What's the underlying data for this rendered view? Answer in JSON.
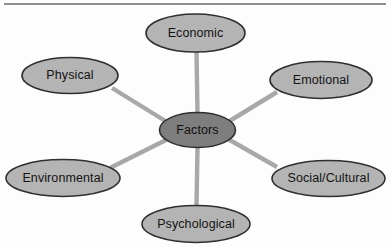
{
  "figure": {
    "background_color": "#fdfdfd",
    "top_rule": {
      "name": "header-rule",
      "color": "#8c8c92",
      "x1": 4,
      "y1": 4,
      "x2": 386,
      "y2": 4,
      "width": 2.2
    }
  },
  "chart_data": {
    "type": "diagram",
    "subtype": "radial-hub-and-spoke",
    "title": "Factors",
    "center_label": "Factors",
    "spoke_count": 6,
    "categories": [
      "Economic",
      "Emotional",
      "Social/Cultural",
      "Psychological",
      "Environmental",
      "Physical"
    ],
    "edges": [
      {
        "from": "Factors",
        "to": "Economic"
      },
      {
        "from": "Factors",
        "to": "Emotional"
      },
      {
        "from": "Factors",
        "to": "Social/Cultural"
      },
      {
        "from": "Factors",
        "to": "Psychological"
      },
      {
        "from": "Factors",
        "to": "Environmental"
      },
      {
        "from": "Factors",
        "to": "Physical"
      }
    ]
  },
  "colors": {
    "node_fill": "#b4b4b4",
    "center_fill": "#7e7e7e",
    "node_stroke": "#2f2f2f",
    "connector": "#a8a8a8",
    "label_text": "#131313",
    "rule": "#8c8c92"
  },
  "center": {
    "name": "center-node-factors",
    "label": "Factors",
    "cx": 197.5,
    "cy": 130,
    "rx": 38,
    "ry": 17.5,
    "fill": "#7e7e7e"
  },
  "nodes": [
    {
      "name": "node-economic",
      "label": "Economic",
      "cx": 195.5,
      "cy": 33,
      "rx": 49.5,
      "ry": 19,
      "fill": "#b4b4b4"
    },
    {
      "name": "node-physical",
      "label": "Physical",
      "cx": 70,
      "cy": 75.5,
      "rx": 48,
      "ry": 18,
      "fill": "#b4b4b4"
    },
    {
      "name": "node-emotional",
      "label": "Emotional",
      "cx": 321,
      "cy": 80,
      "rx": 51,
      "ry": 18.5,
      "fill": "#b4b4b4"
    },
    {
      "name": "node-environmental",
      "label": "Environmental",
      "cx": 63,
      "cy": 178,
      "rx": 57,
      "ry": 18.5,
      "fill": "#b4b4b4"
    },
    {
      "name": "node-social-cultural",
      "label": "Social/Cultural",
      "cx": 328.5,
      "cy": 178.5,
      "rx": 56.5,
      "ry": 18,
      "fill": "#b4b4b4"
    },
    {
      "name": "node-psychological",
      "label": "Psychological",
      "cx": 196,
      "cy": 224,
      "rx": 54,
      "ry": 18.5,
      "fill": "#b4b4b4"
    }
  ],
  "connectors": [
    {
      "name": "connector-economic",
      "x1": 196.5,
      "y1": 52,
      "x2": 197.5,
      "y2": 113,
      "width": 4.4
    },
    {
      "name": "connector-physical",
      "x1": 112,
      "y1": 88,
      "x2": 167,
      "y2": 122,
      "width": 4.4
    },
    {
      "name": "connector-emotional",
      "x1": 277,
      "y1": 92,
      "x2": 228,
      "y2": 122,
      "width": 4.4
    },
    {
      "name": "connector-environmental",
      "x1": 110,
      "y1": 168,
      "x2": 168,
      "y2": 139,
      "width": 4.4
    },
    {
      "name": "connector-social",
      "x1": 277,
      "y1": 167,
      "x2": 228,
      "y2": 139,
      "width": 4.4
    },
    {
      "name": "connector-psychological",
      "x1": 196.5,
      "y1": 205.5,
      "x2": 197.5,
      "y2": 147,
      "width": 4.4
    }
  ]
}
